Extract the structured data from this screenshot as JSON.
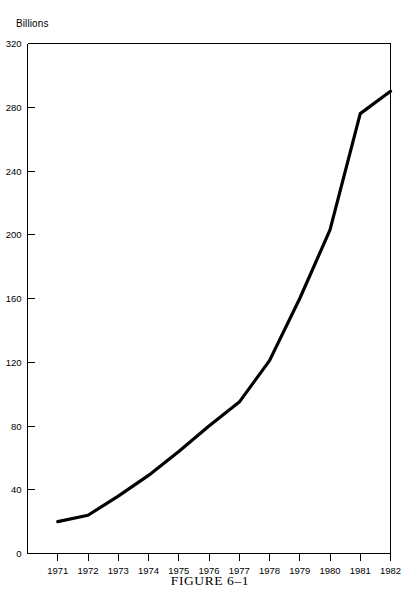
{
  "figure": {
    "caption": "FIGURE 6–1",
    "unit_label": "Billions"
  },
  "chart_data": {
    "type": "line",
    "title": "",
    "subtitle": "",
    "xlabel": "",
    "ylabel": "Billions",
    "categories": [
      "1971",
      "1972",
      "1973",
      "1974",
      "1975",
      "1976",
      "1977",
      "1978",
      "1979",
      "1980",
      "1981",
      "1982"
    ],
    "values": [
      20,
      24,
      36,
      49,
      64,
      80,
      95,
      121,
      160,
      203,
      276,
      290
    ],
    "series": [
      {
        "name": "",
        "values": [
          20,
          24,
          36,
          49,
          64,
          80,
          95,
          121,
          160,
          203,
          276,
          290
        ]
      }
    ],
    "ylim": [
      0,
      320
    ],
    "ytick_values": [
      0,
      40,
      80,
      120,
      160,
      200,
      240,
      280,
      320
    ],
    "ytick_labels": [
      "0",
      "40",
      "80",
      "120",
      "160",
      "200",
      "240",
      "280",
      "320"
    ],
    "xtick_labels": [
      "1971",
      "1972",
      "1973",
      "1974",
      "1975",
      "1976",
      "1977",
      "1978",
      "1979",
      "1980",
      "1981",
      "1982"
    ],
    "grid": false,
    "legend": "none",
    "line_color": "#000000",
    "axis_color": "#000000",
    "background_color": "#ffffff"
  }
}
